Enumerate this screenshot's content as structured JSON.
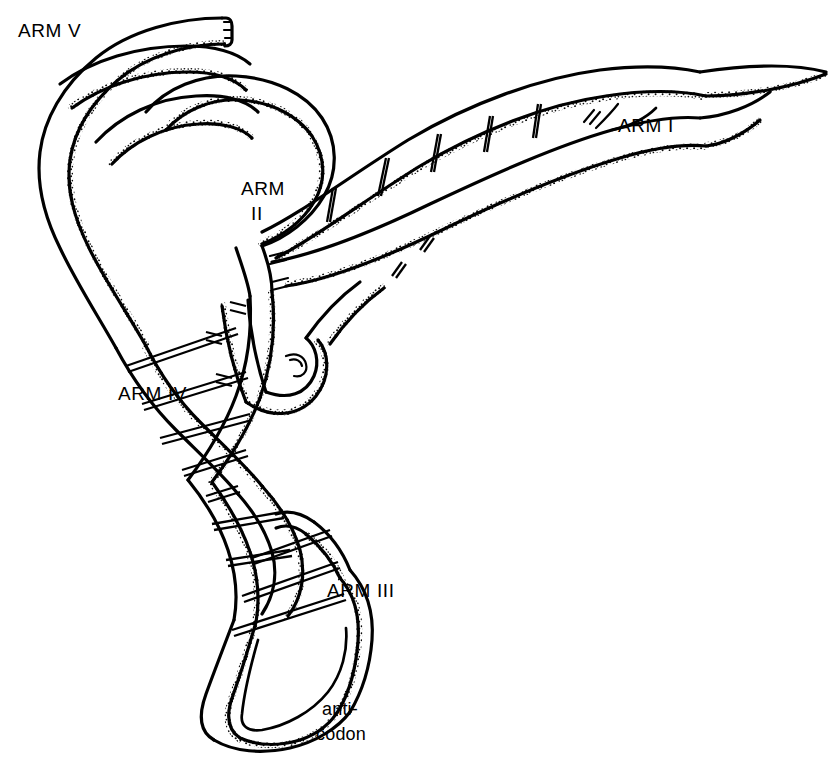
{
  "figure": {
    "background_color": "#ffffff",
    "ink_color": "#000000",
    "style": "hand-drawn line art with stippled shading",
    "width": 840,
    "height": 766
  },
  "labels": {
    "arm_v": "ARM V",
    "arm_i": "ARM I",
    "arm_ii_line1": "ARM",
    "arm_ii_line2": "II",
    "arm_iv": "ARM IV",
    "arm_iii": "ARM III",
    "anticodon_line1": "anti-",
    "anticodon_line2": "codon"
  },
  "diagram_data": {
    "type": "schematic-line-drawing",
    "subject": "transfer RNA (tRNA) ribbon model",
    "arms": [
      {
        "id": "I",
        "label": "ARM I",
        "label_x": 618,
        "label_y": 113,
        "description": "long acceptor-stem double helix extending to upper right, ends in tapered point"
      },
      {
        "id": "II",
        "label": "ARM II",
        "label_x": 241,
        "label_y": 176,
        "description": "short hairpin arm with loop in the middle of the figure"
      },
      {
        "id": "III",
        "label": "ARM III",
        "label_x": 327,
        "label_y": 578,
        "description": "lower arm terminating in the large anticodon loop"
      },
      {
        "id": "IV",
        "label": "ARM IV",
        "label_x": 118,
        "label_y": 381,
        "description": "central twisted double-helix region on the left"
      },
      {
        "id": "V",
        "label": "ARM V",
        "label_x": 18,
        "label_y": 18,
        "description": "upper-left folded ribbon arm with squared-off terminus"
      }
    ],
    "features": [
      {
        "name": "anticodon",
        "label": "anti-codon",
        "label_x": 322,
        "label_y": 697,
        "description": "two-line lowercase label at the bottom of the anticodon loop"
      },
      {
        "name": "base-pair rungs",
        "description": "short straight cross bars linking paired ribbon strands within helical arms"
      },
      {
        "name": "stipple shading",
        "description": "dotted edge texture giving ribbons a three-dimensional appearance"
      }
    ]
  }
}
